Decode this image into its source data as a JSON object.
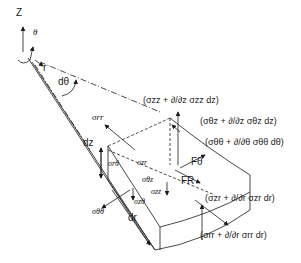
{
  "diagram": {
    "axes": {
      "z_label": "Z",
      "theta_label": "θ",
      "r_label": "r",
      "dtheta_label": "dθ"
    },
    "dimensions": {
      "dz_label": "dz",
      "dr_label": "dr"
    },
    "stresses": {
      "sigma_rr": "σrr",
      "sigma_rtheta": "σrθ",
      "sigma_zr": "σzr",
      "sigma_thetaz": "σθz",
      "sigma_zz": "σzz",
      "sigma_ztheta": "σzθ",
      "sigma_thetatheta": "σθθ"
    },
    "forces": {
      "f_theta": "Fθ",
      "f_r": "FR"
    },
    "expressions": {
      "zz_plus": "(σzz + ∂/∂z σzz dz)",
      "thetaz_plus": "(σθz + ∂/∂z σθz dz)",
      "thetatheta_plus": "(σθθ + ∂/∂θ σθθ dθ)",
      "zr_plus": "(σzr + ∂/∂r σzr dr)",
      "rr_plus": "(σrr + ∂/∂r σrr dr)"
    }
  }
}
